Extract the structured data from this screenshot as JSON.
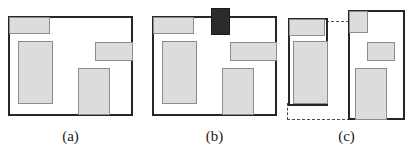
{
  "figure": {
    "width": 414,
    "height": 150,
    "background": "#ffffff",
    "block_fill": "#dcdcdc",
    "block_stroke": "#8c8c8c",
    "dark_block_fill": "#2b2b2b",
    "box_stroke": "#262626",
    "guide_stroke": "#4a4a4a"
  },
  "captions": {
    "a": "(a)",
    "b": "(b)",
    "c": "(c)"
  },
  "panels": {
    "a": {
      "label": "(a)",
      "box": {
        "x": 8,
        "y": 16,
        "w": 125,
        "h": 100
      },
      "blocks": [
        {
          "name": "block-top-left",
          "x": 9,
          "y": 17,
          "w": 41,
          "h": 17
        },
        {
          "name": "block-left-tall",
          "x": 18,
          "y": 41,
          "w": 35,
          "h": 63
        },
        {
          "name": "block-right-wide",
          "x": 95,
          "y": 42,
          "w": 38,
          "h": 19
        },
        {
          "name": "block-bottom-mid",
          "x": 78,
          "y": 68,
          "w": 32,
          "h": 47
        }
      ]
    },
    "b": {
      "label": "(b)",
      "box": {
        "x": 152,
        "y": 16,
        "w": 125,
        "h": 100
      },
      "blocks": [
        {
          "name": "block-top-left",
          "x": 153,
          "y": 17,
          "w": 41,
          "h": 17
        },
        {
          "name": "block-left-tall",
          "x": 162,
          "y": 41,
          "w": 35,
          "h": 63
        },
        {
          "name": "block-right-wide",
          "x": 230,
          "y": 42,
          "w": 47,
          "h": 19
        },
        {
          "name": "block-bottom-mid",
          "x": 222,
          "y": 68,
          "w": 32,
          "h": 47
        },
        {
          "name": "block-dark-overflow",
          "x": 211,
          "y": 8,
          "w": 19,
          "h": 27,
          "dark": true
        }
      ]
    },
    "c": {
      "label": "(c)",
      "left_box": {
        "x": 288,
        "y": 18,
        "w": 40,
        "h": 88
      },
      "right_box": {
        "x": 348,
        "y": 10,
        "w": 57,
        "h": 110
      },
      "left_blocks": [
        {
          "name": "block-top-left",
          "x": 289,
          "y": 19,
          "w": 36,
          "h": 17
        },
        {
          "name": "block-left-tall",
          "x": 293,
          "y": 41,
          "w": 35,
          "h": 63
        }
      ],
      "right_blocks": [
        {
          "name": "block-top-left",
          "x": 349,
          "y": 11,
          "w": 19,
          "h": 22
        },
        {
          "name": "block-right-wide",
          "x": 367,
          "y": 42,
          "w": 28,
          "h": 19
        },
        {
          "name": "block-bottom-mid",
          "x": 355,
          "y": 68,
          "w": 32,
          "h": 52
        }
      ],
      "guides": [
        {
          "name": "guide-top-align",
          "orientation": "horizontal",
          "x": 326,
          "y": 21,
          "length": 79
        },
        {
          "name": "guide-bottom-align",
          "orientation": "horizontal",
          "x": 287,
          "y": 119,
          "length": 118
        },
        {
          "name": "guide-left-edge",
          "orientation": "vertical",
          "x": 287,
          "y": 103,
          "length": 17
        }
      ]
    }
  }
}
